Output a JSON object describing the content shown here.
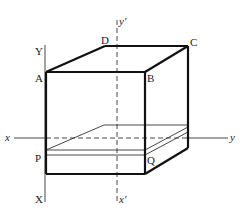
{
  "diagram": {
    "type": "3d-box-projection",
    "vertex_labels": {
      "A": "A",
      "B": "B",
      "C": "C",
      "D": "D",
      "P": "P",
      "Q": "Q"
    },
    "axis_labels": {
      "X": "X",
      "Y": "Y",
      "x": "x",
      "y": "y",
      "x_prime": "x'",
      "y_prime": "y'"
    }
  }
}
